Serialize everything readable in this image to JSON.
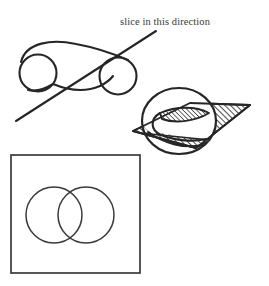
{
  "figure": {
    "background_color": "#ffffff",
    "ink_color": "#262626",
    "hatch_color": "#333333",
    "width": 269,
    "height": 286,
    "annotations": [
      {
        "id": "slice-direction",
        "text": "slice in this direction",
        "x": 120,
        "y": 17,
        "font_size": 10.5,
        "color": "#3a3a3a"
      }
    ],
    "panels": [
      {
        "id": "upper-left-surface",
        "name": "peanut-surface-with-cut-line",
        "description": "two circles joined by an outer curve above and a concave curve below, crossed by a straight diagonal cutting line",
        "circles": [
          {
            "cx": 38,
            "cy": 73,
            "r": 18.5
          },
          {
            "cx": 118,
            "cy": 76,
            "r": 18.5
          }
        ],
        "cut_line": {
          "x1": 16,
          "y1": 121,
          "x2": 156,
          "y2": 31
        }
      },
      {
        "id": "lower-right-solid",
        "name": "blob-with-hatched-cutting-plane",
        "description": "rounded blob intersected by a hatched parallelogram plane, revealing a hatched lens-shaped cross-section",
        "blob": {
          "cx": 179,
          "cy": 121,
          "rx": 37,
          "ry": 33
        },
        "plane": {
          "points": "133,131 190,103 250,105 196,148",
          "hatch_angle_degrees": 45,
          "hatch_spacing": 3
        },
        "lens_cross_section": {
          "description": "leaf/lens shaped hatched sliver inside the blob",
          "hatch_angle_degrees": 45
        }
      },
      {
        "id": "bottom-square-panel",
        "name": "cross-section-result-frame",
        "description": "square frame enclosing two overlapping circles, the resulting cross-section",
        "square": {
          "x": 11,
          "y": 155,
          "width": 129,
          "height": 118
        },
        "circles": [
          {
            "cx": 54,
            "cy": 215,
            "r": 28
          },
          {
            "cx": 86,
            "cy": 215,
            "r": 28
          }
        ]
      }
    ]
  }
}
